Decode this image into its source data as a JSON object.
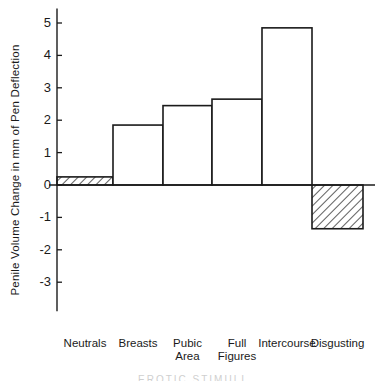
{
  "chart_data": {
    "type": "bar",
    "title": "",
    "subtitle": "",
    "xlabel": "EROTIC STIMULI",
    "ylabel": "Penile Volume Change in mm of Pen Deflection",
    "categories": [
      "Neutrals",
      "Breasts",
      "Pubic Area",
      "Full Figures",
      "Intercourse",
      "Disgusting"
    ],
    "category_lines": [
      [
        "Neutrals",
        ""
      ],
      [
        "Breasts",
        ""
      ],
      [
        "Pubic",
        "Area"
      ],
      [
        "Full",
        "Figures"
      ],
      [
        "Intercourse",
        ""
      ],
      [
        "Disgusting",
        ""
      ]
    ],
    "values": [
      0.25,
      1.85,
      2.45,
      2.65,
      4.85,
      -1.35
    ],
    "bar_fill": [
      "hatched",
      "white",
      "white",
      "white",
      "white",
      "hatched"
    ],
    "ylim": [
      -3.6,
      5.4
    ],
    "yticks": [
      5,
      4,
      3,
      2,
      1,
      0,
      -1,
      -2,
      -3
    ],
    "ytick_labels": [
      "5",
      "4",
      "3",
      "2",
      "1",
      "0",
      "-1",
      "-2",
      "-3"
    ],
    "grid": false,
    "legend": "none",
    "line_color": "#1a1a1a",
    "background_color": "#ffffff"
  }
}
